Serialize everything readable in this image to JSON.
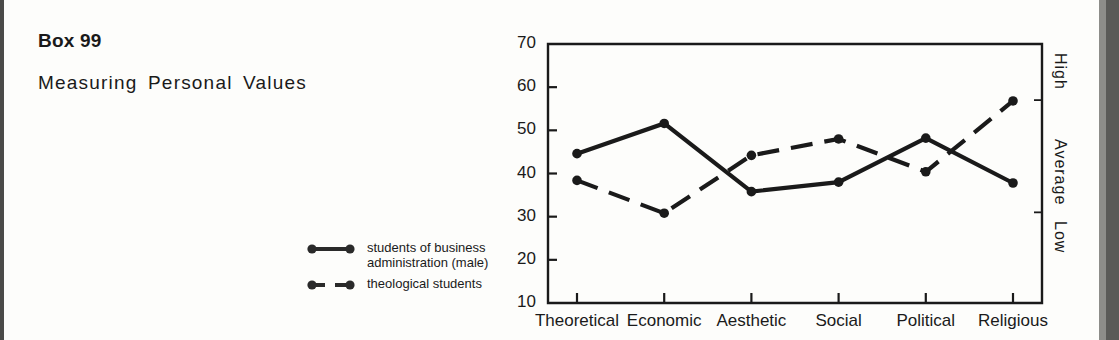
{
  "box": {
    "label": "Box 99",
    "title": "Measuring Personal Values"
  },
  "legend": {
    "items": [
      {
        "name": "solid-line-series",
        "style": "solid",
        "label": "students of business\nadministration (male)"
      },
      {
        "name": "dashed-line-series",
        "style": "dashed",
        "label": "theological students"
      }
    ]
  },
  "chart_data": {
    "type": "line",
    "title": "",
    "xlabel": "",
    "ylabel": "",
    "ylim": [
      10,
      70
    ],
    "yticks": [
      10,
      20,
      30,
      40,
      50,
      60,
      70
    ],
    "ytick_labels": [
      "10",
      "20",
      "30",
      "40",
      "50",
      "60",
      "70"
    ],
    "grid": false,
    "legend_position": "left-outside",
    "categories": [
      "Theoretical",
      "Economic",
      "Aesthetic",
      "Social",
      "Political",
      "Religious"
    ],
    "right_axis_labels": [
      "High",
      "Average",
      "Low"
    ],
    "right_axis_tick_values": [
      57,
      31
    ],
    "series": [
      {
        "name": "students of business administration (male)",
        "style": "solid",
        "values": [
          44.6,
          51.6,
          35.8,
          38.0,
          48.2,
          37.8
        ]
      },
      {
        "name": "theological students",
        "style": "dashed",
        "values": [
          38.4,
          30.8,
          44.2,
          48.0,
          40.4,
          56.8
        ]
      }
    ]
  },
  "colors": {
    "ink": "#1a1a1a",
    "paper": "#fdfdfb",
    "edge": "#4a4a48"
  }
}
